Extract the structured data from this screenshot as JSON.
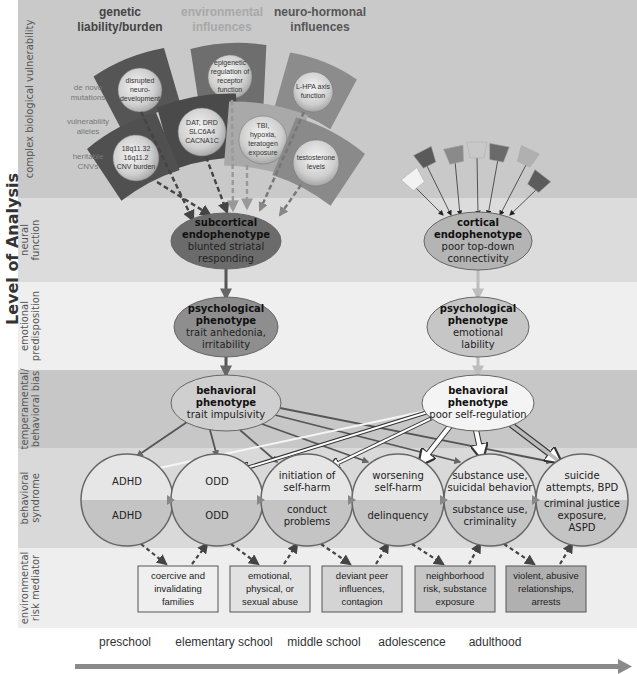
{
  "side_title": "Level of Analysis",
  "levels": [
    {
      "id": "vulnerability",
      "label": [
        "complex biological vulnerability"
      ],
      "color": "#c9c9c9"
    },
    {
      "id": "neural",
      "label": [
        "neural",
        "function"
      ],
      "color": "#dcdcdc"
    },
    {
      "id": "emotional",
      "label": [
        "emotional",
        "predisposition"
      ],
      "color": "#efefef"
    },
    {
      "id": "temperamental",
      "label": [
        "temperamental/",
        "behavioral bias"
      ],
      "color": "#c7c7c7"
    },
    {
      "id": "syndrome",
      "label": [
        "behavioral",
        "syndrome"
      ],
      "color": "#d9d9d9"
    },
    {
      "id": "environmental",
      "label": [
        "environmental",
        "risk mediator"
      ],
      "color": "#eeeeee"
    }
  ],
  "influence_headers": [
    {
      "lines": [
        "genetic",
        "liability/burden"
      ],
      "color": "#444444"
    },
    {
      "lines": [
        "environmental",
        "influences"
      ],
      "color": "#a8a8a8"
    },
    {
      "lines": [
        "neuro-hormonal",
        "influences"
      ],
      "color": "#555555"
    }
  ],
  "genetic_row_labels": [
    {
      "lines": [
        "de novo",
        "mutations"
      ]
    },
    {
      "lines": [
        "vulnerability",
        "alleles"
      ]
    },
    {
      "lines": [
        "heritable",
        "CNVs"
      ]
    }
  ],
  "vulnerability_factors": [
    {
      "lines": [
        "disrupted",
        "neuro-",
        "development"
      ],
      "fill": "#555555"
    },
    {
      "lines": [
        "epigenetic",
        "regulation of",
        "receptor",
        "function"
      ],
      "fill": "#6e6e6e"
    },
    {
      "lines": [
        "L-HPA axis",
        "function"
      ],
      "fill": "#8c8c8c"
    },
    {
      "lines": [
        "DAT, DRD",
        "SLC6A4",
        "CACNA1C"
      ],
      "fill": "#4a4a4a"
    },
    {
      "lines": [
        "TBI,",
        "hypoxia,",
        "teratogen",
        "exposure"
      ],
      "fill": "#a9a9a9"
    },
    {
      "lines": [
        "18q11.32",
        "16q11.2",
        "CNV burden"
      ],
      "fill": "#505050"
    },
    {
      "lines": [
        "testosterone",
        "levels"
      ],
      "fill": "#8a8a8a"
    }
  ],
  "cortical_factor_colors": [
    "#f2f2f2",
    "#5a5a5a",
    "#8a8a8a",
    "#c8c8c8",
    "#6a6a6a",
    "#b0b0b0",
    "#5c5c5c"
  ],
  "left_chain": {
    "endophenotype": {
      "title": [
        "subcortical",
        "endophenotype"
      ],
      "desc": [
        "blunted striatal",
        "responding"
      ],
      "fill": "#6b6b6b"
    },
    "psychological": {
      "title": [
        "psychological",
        "phenotype"
      ],
      "desc": [
        "trait anhedonia,",
        "irritability"
      ],
      "fill": "#8e8e8e"
    },
    "behavioral": {
      "title": [
        "behavioral",
        "phenotype"
      ],
      "desc": [
        "trait impulsivity"
      ],
      "fill": "#cfcfcf"
    }
  },
  "right_chain": {
    "endophenotype": {
      "title": [
        "cortical",
        "endophenotype"
      ],
      "desc": [
        "poor top-down",
        "connectivity"
      ],
      "fill": "#b4b4b4"
    },
    "psychological": {
      "title": [
        "psychological",
        "phenotype"
      ],
      "desc": [
        "emotional",
        "lability"
      ],
      "fill": "#c6c6c6"
    },
    "behavioral": {
      "title": [
        "behavioral",
        "phenotype"
      ],
      "desc": [
        "poor self-regulation"
      ],
      "fill": "#f4f4f4"
    }
  },
  "syndromes": [
    {
      "top": [
        "ADHD"
      ],
      "bottom": [
        "ADHD"
      ]
    },
    {
      "top": [
        "ODD"
      ],
      "bottom": [
        "ODD"
      ]
    },
    {
      "top": [
        "initiation of",
        "self-harm"
      ],
      "bottom": [
        "conduct",
        "problems"
      ]
    },
    {
      "top": [
        "worsening",
        "self-harm"
      ],
      "bottom": [
        "delinquency"
      ]
    },
    {
      "top": [
        "substance use,",
        "suicidal behavior"
      ],
      "bottom": [
        "substance use,",
        "criminality"
      ]
    },
    {
      "top": [
        "suicide",
        "attempts, BPD"
      ],
      "bottom": [
        "criminal justice",
        "exposure,",
        "ASPD"
      ]
    }
  ],
  "mediators": [
    {
      "lines": [
        "coercive and",
        "invalidating",
        "families"
      ],
      "fill": "#efefef"
    },
    {
      "lines": [
        "emotional,",
        "physical, or",
        "sexual abuse"
      ],
      "fill": "#e2e2e2"
    },
    {
      "lines": [
        "deviant peer",
        "influences,",
        "contagion"
      ],
      "fill": "#d4d4d4"
    },
    {
      "lines": [
        "neighborhood",
        "risk, substance",
        "exposure"
      ],
      "fill": "#c6c6c6"
    },
    {
      "lines": [
        "violent, abusive",
        "relationships,",
        "arrests"
      ],
      "fill": "#b0b0b0"
    }
  ],
  "timeline": [
    "preschool",
    "elementary school",
    "middle school",
    "adolescence",
    "adulthood"
  ]
}
